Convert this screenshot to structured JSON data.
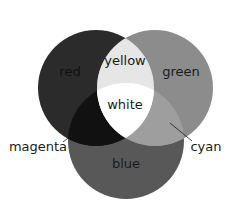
{
  "diagram": {
    "type": "venn",
    "title": "",
    "circles": [
      {
        "id": "red",
        "label": "red",
        "color": "#2b2b2b"
      },
      {
        "id": "green",
        "label": "green",
        "color": "#8c8c8c"
      },
      {
        "id": "blue",
        "label": "blue",
        "color": "#585858"
      }
    ],
    "intersections": [
      {
        "sets": [
          "red",
          "green"
        ],
        "label": "yellow",
        "color": "#e6e6e6"
      },
      {
        "sets": [
          "red",
          "blue"
        ],
        "label": "magenta",
        "color": "#111111"
      },
      {
        "sets": [
          "green",
          "blue"
        ],
        "label": "cyan",
        "color": "#9e9e9e"
      },
      {
        "sets": [
          "red",
          "green",
          "blue"
        ],
        "label": "white",
        "color": "#ffffff"
      }
    ]
  },
  "labels": {
    "red": "red",
    "green": "green",
    "blue": "blue",
    "yellow": "yellow",
    "white": "white",
    "magenta": "magenta",
    "cyan": "cyan"
  }
}
